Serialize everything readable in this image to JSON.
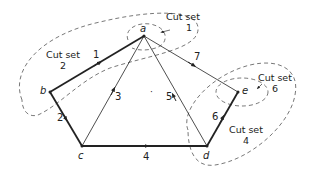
{
  "diagram": {
    "type": "directed-graph-cut-sets",
    "colors": {
      "line": "#222222",
      "dashed": "#555555",
      "background": "#ffffff"
    },
    "vertices": [
      {
        "id": "a",
        "label": "a",
        "x": 144,
        "y": 36
      },
      {
        "id": "b",
        "label": "b",
        "x": 50,
        "y": 92
      },
      {
        "id": "c",
        "label": "c",
        "x": 82,
        "y": 146
      },
      {
        "id": "d",
        "label": "d",
        "x": 207,
        "y": 146
      },
      {
        "id": "e",
        "label": "e",
        "x": 238,
        "y": 92
      }
    ],
    "edges": [
      {
        "id": "1",
        "label": "1",
        "from": "b",
        "to": "a",
        "weight": "thick"
      },
      {
        "id": "2",
        "label": "2",
        "from": "b",
        "to": "c",
        "weight": "thick"
      },
      {
        "id": "3",
        "label": "3",
        "from": "c",
        "to": "a",
        "weight": "thin"
      },
      {
        "id": "4",
        "label": "4",
        "from": "c",
        "to": "d",
        "weight": "thick"
      },
      {
        "id": "5",
        "label": "5",
        "from": "d",
        "to": "a",
        "weight": "thin"
      },
      {
        "id": "6",
        "label": "6",
        "from": "d",
        "to": "e",
        "weight": "thick"
      },
      {
        "id": "7",
        "label": "7",
        "from": "a",
        "to": "e",
        "weight": "thin"
      }
    ],
    "cut_sets": [
      {
        "id": "1",
        "title": "Cut set",
        "number": "1",
        "encloses": [
          "a"
        ]
      },
      {
        "id": "2",
        "title": "Cut set",
        "number": "2",
        "encloses": [
          "a",
          "b"
        ]
      },
      {
        "id": "4",
        "title": "Cut set",
        "number": "4",
        "encloses": [
          "d",
          "e"
        ]
      },
      {
        "id": "6",
        "title": "Cut set",
        "number": "6",
        "encloses": [
          "e"
        ]
      }
    ],
    "center_mark": "·"
  }
}
